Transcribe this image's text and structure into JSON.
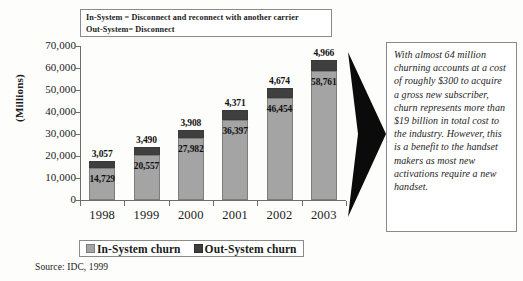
{
  "definition_box": {
    "lines": [
      "In-System = Disconnect and reconnect with another carrier",
      "Out-System= Disconnect"
    ]
  },
  "axis": {
    "y_title": "(Millions)",
    "y_ticks": [
      "70,000",
      "60,000",
      "50,000",
      "40,000",
      "30,000",
      "20,000",
      "10,000",
      "0"
    ]
  },
  "legend": {
    "items": [
      {
        "label": "In-System churn",
        "color": "#a4a4a4"
      },
      {
        "label": "Out-System churn",
        "color": "#3f3f3f"
      }
    ]
  },
  "source_note": "Source: IDC, 1999",
  "callout": {
    "text": "With almost 64 million churning accounts at a cost of roughly $300 to acquire a gross new subscriber, churn represents more than $19 billion in total cost to the industry. However, this is a benefit to the handset makers as most new activations require a new handset."
  },
  "chart_data": {
    "type": "bar",
    "stacked": true,
    "title": "",
    "xlabel": "",
    "ylabel": "(Millions)",
    "ylim": [
      0,
      70000
    ],
    "ytick_step": 10000,
    "grid": false,
    "legend_position": "bottom",
    "categories": [
      "1998",
      "1999",
      "2000",
      "2001",
      "2002",
      "2003"
    ],
    "series": [
      {
        "name": "In-System churn",
        "color": "#a4a4a4",
        "values": [
          14729,
          20557,
          27982,
          36397,
          46454,
          58761
        ],
        "labels": [
          "14,729",
          "20,557",
          "27,982",
          "36,397",
          "46,454",
          "58,761"
        ]
      },
      {
        "name": "Out-System churn",
        "color": "#3f3f3f",
        "values": [
          3057,
          3490,
          3908,
          4371,
          4674,
          4966
        ],
        "labels": [
          "3,057",
          "3,490",
          "3,908",
          "4,371",
          "4,674",
          "4,966"
        ]
      }
    ],
    "totals": [
      17786,
      24047,
      31890,
      40768,
      51128,
      63727
    ]
  }
}
